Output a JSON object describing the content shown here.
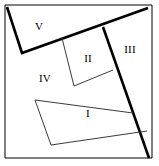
{
  "figure": {
    "canvas": {
      "width": 159,
      "height": 166
    },
    "colors": {
      "background": "#ffffff",
      "stroke": "#000000",
      "thin_stroke": "#3a3a3a",
      "label": "#000000"
    },
    "outer_frame": {
      "name": "outer-border",
      "points": "5,5 152,5 152,158 5,158",
      "stroke_width": 1
    },
    "thick_edges": [
      {
        "name": "edge-top-left-wedge",
        "points": "7,7 22,53 148,8",
        "stroke_width": 2.6
      },
      {
        "name": "edge-right-diagonal",
        "points": "103,27 149,158",
        "stroke_width": 2.6
      }
    ],
    "thin_edges": [
      {
        "name": "edge-region-ii-left",
        "points": "62,38 74,86",
        "stroke_width": 1
      },
      {
        "name": "edge-region-ii-bottom",
        "points": "74,86 113,70",
        "stroke_width": 1
      },
      {
        "name": "edge-rect-i-top",
        "points": "35,100 133,113",
        "stroke_width": 1
      },
      {
        "name": "edge-rect-i-left",
        "points": "35,100 51,145",
        "stroke_width": 1
      },
      {
        "name": "edge-rect-i-bottom",
        "points": "51,145 147,131",
        "stroke_width": 1
      }
    ],
    "labels": [
      {
        "name": "region-label-v",
        "text": "V",
        "x": 39,
        "y": 26
      },
      {
        "name": "region-label-ii",
        "text": "II",
        "x": 88,
        "y": 58
      },
      {
        "name": "region-label-iii",
        "text": "III",
        "x": 130,
        "y": 49
      },
      {
        "name": "region-label-iv",
        "text": "IV",
        "x": 45,
        "y": 78
      },
      {
        "name": "region-label-i",
        "text": "I",
        "x": 88,
        "y": 113
      }
    ]
  }
}
